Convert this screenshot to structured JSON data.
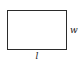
{
  "figure": {
    "name": "rectangle-dimension-diagram",
    "background_color": "#ffffff",
    "shape": {
      "type": "rectangle",
      "stroke_color": "#2b2b2b",
      "fill_color": "#ffffff",
      "stroke_width_px": 1
    },
    "labels": {
      "length": "l",
      "width": "w"
    }
  }
}
